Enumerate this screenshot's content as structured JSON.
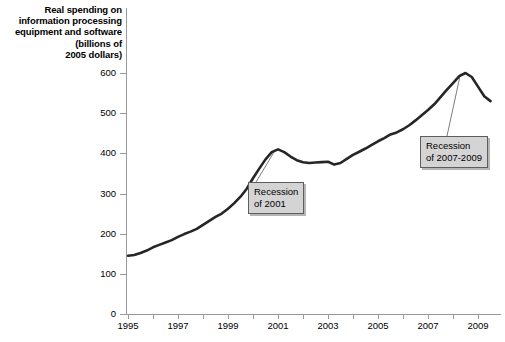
{
  "chart_data": {
    "type": "line",
    "title": "Real spending on information processing equipment and software (billions of 2005 dollars)",
    "title_lines": [
      "Real spending on",
      "information processing",
      "equipment and software",
      "(billions of",
      "2005 dollars)"
    ],
    "xlabel": "",
    "ylabel": "",
    "xlim": [
      1995,
      2009.6
    ],
    "ylim": [
      0,
      630
    ],
    "ytick_values": [
      0,
      100,
      200,
      300,
      400,
      500,
      600
    ],
    "ytick_labels": [
      "0",
      "100",
      "200",
      "300",
      "400",
      "500",
      "600"
    ],
    "xtick_values": [
      1995,
      1996,
      1997,
      1998,
      1999,
      2000,
      2001,
      2002,
      2003,
      2004,
      2005,
      2006,
      2007,
      2008,
      2009
    ],
    "xtick_labels": [
      "1995",
      "",
      "1997",
      "",
      "1999",
      "",
      "2001",
      "",
      "2003",
      "",
      "2005",
      "",
      "2007",
      "",
      "2009"
    ],
    "grid": false,
    "legend": false,
    "line_color": "#262626",
    "line_width": 2.6,
    "series": [
      {
        "name": "Real spending on information processing equipment and software",
        "x": [
          1995.0,
          1995.25,
          1995.5,
          1995.75,
          1996.0,
          1996.25,
          1996.5,
          1996.75,
          1997.0,
          1997.25,
          1997.5,
          1997.75,
          1998.0,
          1998.25,
          1998.5,
          1998.75,
          1999.0,
          1999.25,
          1999.5,
          1999.75,
          2000.0,
          2000.25,
          2000.5,
          2000.75,
          2001.0,
          2001.25,
          2001.5,
          2001.75,
          2002.0,
          2002.25,
          2002.5,
          2002.75,
          2003.0,
          2003.25,
          2003.5,
          2003.75,
          2004.0,
          2004.25,
          2004.5,
          2004.75,
          2005.0,
          2005.25,
          2005.5,
          2005.75,
          2006.0,
          2006.25,
          2006.5,
          2006.75,
          2007.0,
          2007.25,
          2007.5,
          2007.75,
          2008.0,
          2008.25,
          2008.5,
          2008.75,
          2009.0,
          2009.25,
          2009.5
        ],
        "y": [
          145,
          147,
          152,
          158,
          166,
          172,
          178,
          184,
          192,
          199,
          205,
          212,
          222,
          232,
          242,
          250,
          262,
          276,
          292,
          312,
          338,
          362,
          385,
          403,
          410,
          403,
          392,
          383,
          378,
          376,
          377,
          378,
          379,
          372,
          376,
          386,
          396,
          404,
          412,
          421,
          430,
          438,
          447,
          452,
          460,
          470,
          482,
          495,
          508,
          522,
          540,
          558,
          575,
          592,
          600,
          590,
          566,
          542,
          530
        ]
      }
    ],
    "annotations": [
      {
        "id": "recession-2001",
        "lines": [
          "Recession",
          "of 2001"
        ],
        "text": "Recession of 2001",
        "points_to_x": 2000.85,
        "points_to_y": 404
      },
      {
        "id": "recession-2007-2009",
        "lines": [
          "Recession",
          "of 2007-2009"
        ],
        "text": "Recession of 2007-2009",
        "points_to_x": 2008.3,
        "points_to_y": 598
      }
    ]
  },
  "axis": {
    "line_color": "#9a9a9a"
  }
}
